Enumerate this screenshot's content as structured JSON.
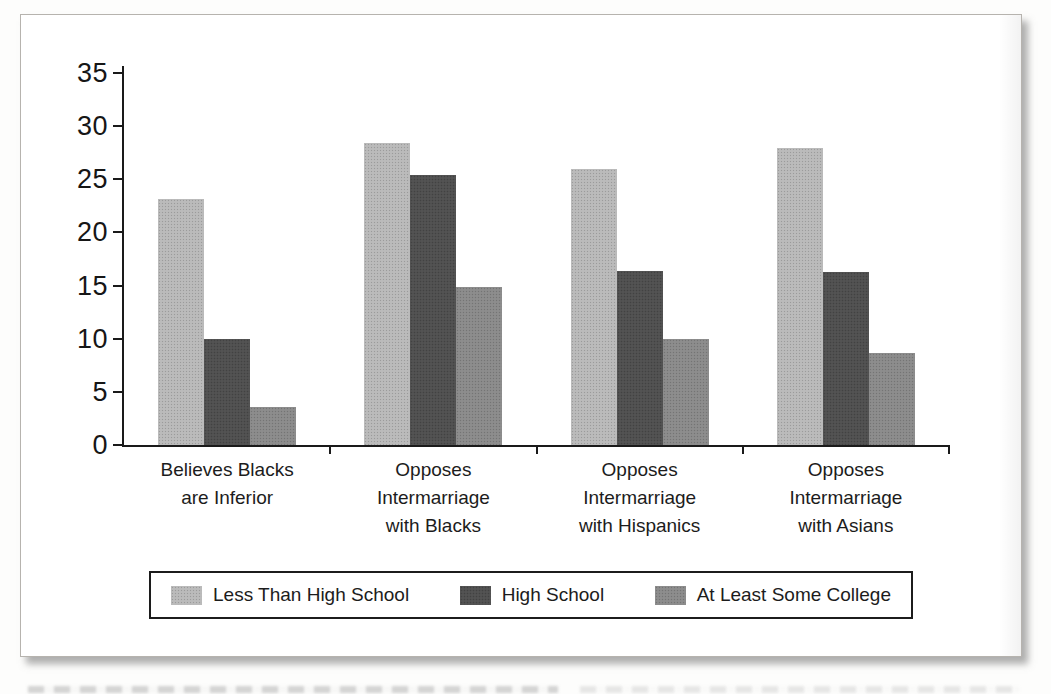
{
  "figure": {
    "panel_background": "#ffffff",
    "panel_border_color": "#b6b3ae",
    "axis_color": "#1a1a1a"
  },
  "chart_data": {
    "type": "bar",
    "title": "",
    "xlabel": "",
    "ylabel": "",
    "categories": [
      "Believes Blacks are Inferior",
      "Opposes Intermarriage with Blacks",
      "Opposes Intermarriage with Hispanics",
      "Opposes Intermarriage with Asians"
    ],
    "category_label_lines": [
      [
        "Believes Blacks",
        "are Inferior"
      ],
      [
        "Opposes",
        "Intermarriage",
        "with Blacks"
      ],
      [
        "Opposes",
        "Intermarriage",
        "with Hispanics"
      ],
      [
        "Opposes",
        "Intermarriage",
        "with Asians"
      ]
    ],
    "series": [
      {
        "name": "Less Than High School",
        "color": "#b9b9b9",
        "values": [
          23.1,
          28.4,
          26.0,
          27.9
        ]
      },
      {
        "name": "High School",
        "color": "#4f4f4f",
        "values": [
          10.0,
          25.4,
          16.4,
          16.3
        ]
      },
      {
        "name": "At Least Some College",
        "color": "#8a8a8a",
        "values": [
          3.6,
          14.9,
          10.0,
          8.7
        ]
      }
    ],
    "ylim": [
      0,
      35
    ],
    "yticks": [
      0,
      5,
      10,
      15,
      20,
      25,
      30,
      35
    ],
    "grid": false,
    "legend_position": "bottom-boxed"
  }
}
